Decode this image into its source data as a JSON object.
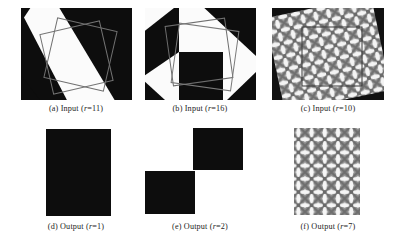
{
  "figure": {
    "background": "#ffffff",
    "ink": "#0d0d0d",
    "outline_color": "#6e6e6e",
    "rows": 2,
    "cols": 3
  },
  "panels": [
    {
      "id": "a",
      "label": "(a)",
      "kind": "Input",
      "caption": "(a) Input (r=11)",
      "param_name": "r",
      "param_value": "11",
      "content": "binary diagonal white band on black field with two overlapping rotated square outlines"
    },
    {
      "id": "b",
      "label": "(b)",
      "kind": "Input",
      "caption": "(b) Input (r=16)",
      "param_name": "r",
      "param_value": "16",
      "content": "binary diagonal checkerboard of black and white blocks with two overlapping rotated square outlines"
    },
    {
      "id": "c",
      "label": "(c)",
      "kind": "Input",
      "caption": "(c) Input (r=10)",
      "param_name": "r",
      "param_value": "10",
      "content": "rotated grayscale woven basket texture patch on black background with a square outline overlay"
    },
    {
      "id": "d",
      "label": "(d)",
      "kind": "Output",
      "caption": "(d) Output (r=1)",
      "param_name": "r",
      "param_value": "1",
      "content": "single solid black rectangle on white"
    },
    {
      "id": "e",
      "label": "(e)",
      "kind": "Output",
      "caption": "(e) Output (r=2)",
      "param_name": "r",
      "param_value": "2",
      "content": "two black rectangles offset diagonally on white"
    },
    {
      "id": "f",
      "label": "(f)",
      "kind": "Output",
      "caption": "(f) Output (r=7)",
      "param_name": "r",
      "param_value": "7",
      "content": "axis-aligned grayscale woven basket texture, five columns by four rows of bowtie motifs"
    }
  ]
}
